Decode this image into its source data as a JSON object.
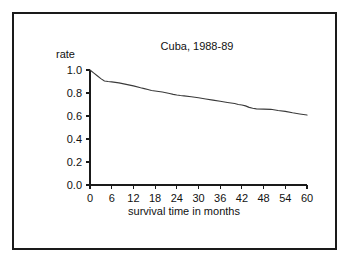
{
  "figure": {
    "background_color": "#ffffff",
    "frame_color": "#1a1a1a",
    "line_color": "#3a3a3a"
  },
  "chart_data": {
    "type": "line",
    "title": "Cuba, 1988-89",
    "xlabel": "survival time in months",
    "ylabel": "rate",
    "xlim": [
      0,
      60
    ],
    "ylim": [
      0.0,
      1.0
    ],
    "grid": false,
    "legend": null,
    "xticks": [
      0,
      6,
      12,
      18,
      24,
      30,
      36,
      42,
      48,
      54,
      60
    ],
    "xtick_labels": [
      "0",
      "6",
      "12",
      "18",
      "24",
      "30",
      "36",
      "42",
      "48",
      "54",
      "60"
    ],
    "yticks": [
      0.0,
      0.2,
      0.4,
      0.6,
      0.8,
      1.0
    ],
    "ytick_labels": [
      "0.0",
      "0.2",
      "0.4",
      "0.6",
      "0.8",
      "1.0"
    ],
    "series": [
      {
        "name": "survival rate",
        "x": [
          0,
          1,
          2,
          3,
          4,
          5,
          6,
          8,
          10,
          12,
          14,
          15,
          16,
          17,
          18,
          20,
          21,
          22,
          23,
          24,
          25,
          26,
          28,
          30,
          32,
          34,
          36,
          38,
          40,
          41,
          42,
          43,
          44,
          45,
          46,
          48,
          50,
          52,
          54,
          56,
          58,
          60
        ],
        "y": [
          1.0,
          0.975,
          0.95,
          0.925,
          0.905,
          0.9,
          0.897,
          0.888,
          0.875,
          0.862,
          0.845,
          0.838,
          0.83,
          0.822,
          0.818,
          0.808,
          0.802,
          0.795,
          0.788,
          0.782,
          0.778,
          0.775,
          0.768,
          0.758,
          0.748,
          0.738,
          0.728,
          0.718,
          0.708,
          0.7,
          0.695,
          0.688,
          0.675,
          0.668,
          0.662,
          0.66,
          0.658,
          0.648,
          0.64,
          0.628,
          0.618,
          0.608
        ]
      }
    ]
  }
}
